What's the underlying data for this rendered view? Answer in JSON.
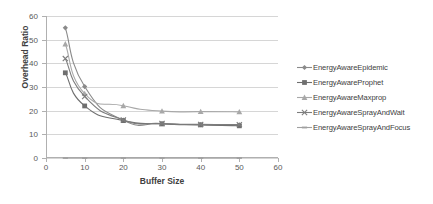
{
  "chart_data": {
    "type": "line",
    "title": "",
    "xlabel": "Buffer Size",
    "ylabel": "Overhead Ratio",
    "x": [
      5,
      10,
      20,
      30,
      40,
      50
    ],
    "xlim": [
      0,
      60
    ],
    "ylim": [
      0,
      60
    ],
    "xticks": [
      0,
      10,
      20,
      30,
      40,
      50,
      60
    ],
    "yticks": [
      0,
      10,
      20,
      30,
      40,
      50,
      60
    ],
    "grid": "horizontal",
    "legend_position": "right",
    "series": [
      {
        "name": "EnergyAwareEpidemic",
        "marker": "diamond",
        "color": "#8a8a8a",
        "values": [
          55.0,
          30.2,
          16.0,
          14.5,
          14.1,
          14.0
        ]
      },
      {
        "name": "EnergyAwareProphet",
        "marker": "square",
        "color": "#6f6f6f",
        "values": [
          36.0,
          22.0,
          15.8,
          14.4,
          14.0,
          13.6
        ]
      },
      {
        "name": "EnergyAwareMaxprop",
        "marker": "triangle",
        "color": "#a8a8a8",
        "values": [
          48.2,
          27.2,
          22.1,
          19.8,
          19.6,
          19.5
        ]
      },
      {
        "name": "EnergyAwareSprayAndWait",
        "marker": "cross",
        "color": "#7d7d7d",
        "values": [
          42.0,
          26.0,
          16.1,
          14.6,
          14.2,
          14.1
        ]
      },
      {
        "name": "EnergyAwareSprayAndFocus",
        "marker": "dash",
        "color": "#a0a0a0",
        "values": [
          0,
          0,
          0,
          0,
          0,
          0
        ]
      }
    ]
  }
}
